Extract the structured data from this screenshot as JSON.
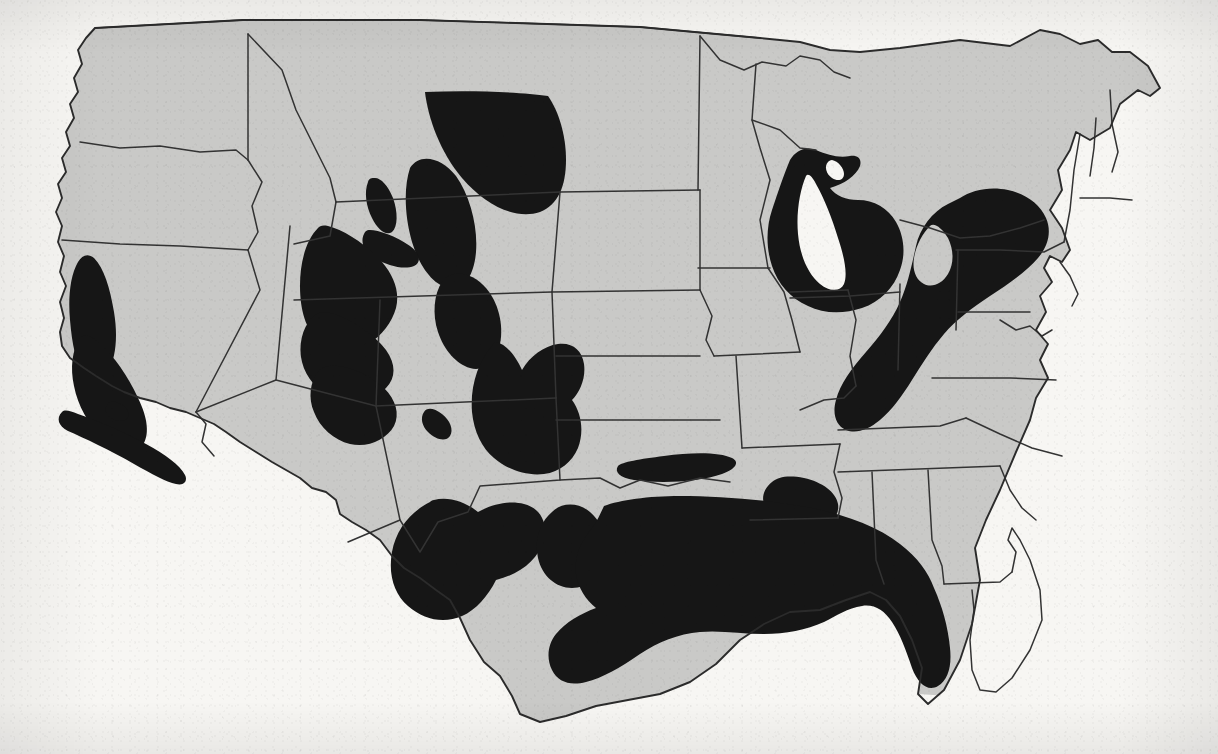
{
  "document": {
    "kind": "scanned-map",
    "title": "Map of the contiguous United States with shaded resource regions",
    "caption_visible": false,
    "page_background_color": "#f7f6f3"
  },
  "map": {
    "projection_note": "conterminous United States, state outlines",
    "land_fill_color": "#c9c9c7",
    "shaded_region_color": "#161616",
    "water_fill_color": "#f7f6f3",
    "border_color": "#2b2b2b",
    "legend_present": false,
    "labels_present": false,
    "shaded_regions": [
      {
        "id": "sacramento-valley",
        "name": "Sacramento Valley",
        "state": "California"
      },
      {
        "id": "san-joaquin-valley",
        "name": "San Joaquin Valley",
        "state": "California"
      },
      {
        "id": "los-angeles-coastal",
        "name": "Southern California coastal belt",
        "state": "California"
      },
      {
        "id": "williston-basin",
        "name": "Williston Basin",
        "state": "Montana / North Dakota"
      },
      {
        "id": "powder-river-basin",
        "name": "Powder River Basin",
        "state": "Wyoming / Montana"
      },
      {
        "id": "bighorn-basin",
        "name": "Bighorn Basin",
        "state": "Wyoming"
      },
      {
        "id": "wind-river-basin",
        "name": "Wind River Basin",
        "state": "Wyoming"
      },
      {
        "id": "green-river-basin",
        "name": "Green River Basin",
        "state": "Wyoming"
      },
      {
        "id": "denver-basin",
        "name": "Denver Basin",
        "state": "Colorado / Nebraska"
      },
      {
        "id": "uinta-piceance-basin",
        "name": "Uinta–Piceance Basin",
        "state": "Utah / Colorado"
      },
      {
        "id": "paradox-basin",
        "name": "Paradox Basin",
        "state": "Utah / Colorado"
      },
      {
        "id": "san-juan-basin",
        "name": "San Juan Basin",
        "state": "New Mexico / Colorado"
      },
      {
        "id": "mid-continent",
        "name": "Mid-Continent / Anadarko Basin",
        "state": "Kansas / Oklahoma"
      },
      {
        "id": "arkoma-basin",
        "name": "Arkoma Basin",
        "state": "Oklahoma / Arkansas"
      },
      {
        "id": "permian-basin",
        "name": "Permian Basin",
        "state": "West Texas / New Mexico"
      },
      {
        "id": "fort-worth-basin",
        "name": "Fort Worth Basin",
        "state": "North Texas"
      },
      {
        "id": "gulf-coast-basin",
        "name": "Gulf Coast Basin",
        "state": "Texas / Louisiana / Mississippi / Alabama / Florida panhandle"
      },
      {
        "id": "mississippi-embayment",
        "name": "Mississippi Embayment",
        "state": "Arkansas / Mississippi"
      },
      {
        "id": "michigan-basin",
        "name": "Michigan Basin",
        "state": "Michigan"
      },
      {
        "id": "appalachian-basin",
        "name": "Appalachian Basin",
        "state": "Pennsylvania / West Virginia / Kentucky / Tennessee / Virginia / Ohio"
      }
    ],
    "unshaded_states": [
      "Washington",
      "Oregon",
      "Idaho",
      "Nevada",
      "Arizona",
      "Minnesota",
      "Wisconsin",
      "Iowa",
      "Missouri",
      "Illinois",
      "Indiana",
      "Maine",
      "New Hampshire",
      "Vermont",
      "Massachusetts",
      "Connecticut",
      "Rhode Island",
      "New Jersey",
      "Delaware",
      "Maryland",
      "Florida peninsula",
      "Georgia",
      "South Carolina",
      "North Carolina"
    ]
  },
  "bleed_through": {
    "note": "Faint mirror-reversed text showing through from the reverse side of the printed page",
    "line_1": "the previous discussion shows",
    "line_2": "which is",
    "line_3": "table"
  }
}
